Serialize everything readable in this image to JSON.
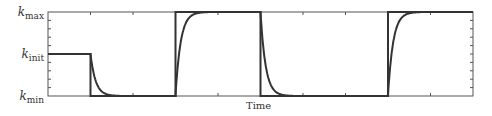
{
  "chart_data": {
    "type": "line",
    "title": "",
    "xlabel": "Time",
    "ylabel": "",
    "y_tick_labels": [
      {
        "base": "k",
        "sub": "max",
        "level": 1.0
      },
      {
        "base": "k",
        "sub": "init",
        "level": 0.5
      },
      {
        "base": "k",
        "sub": "min",
        "level": 0.0
      }
    ],
    "xlim": [
      0,
      10
    ],
    "ylim": [
      0,
      1
    ],
    "x_ticks": [
      0,
      1,
      2,
      3,
      4,
      5,
      6,
      7,
      8,
      9,
      10
    ],
    "y_minor_ticks": 10,
    "grid": false,
    "series": [
      {
        "name": "target (step input)",
        "style": "step",
        "x": [
          0,
          1,
          1,
          3,
          3,
          5,
          5,
          8,
          8,
          10
        ],
        "values": [
          0.5,
          0.5,
          0,
          0,
          1,
          1,
          0,
          0,
          1,
          1
        ]
      },
      {
        "name": "response (exponential relaxation)",
        "style": "smooth",
        "initial": 0.5,
        "steps_at": [
          1,
          3,
          5,
          8
        ],
        "targets": [
          0,
          1,
          0,
          1
        ],
        "time_constant": 0.12
      }
    ]
  },
  "labels": {
    "kmax_base": "k",
    "kmax_sub": "max",
    "kinit_base": "k",
    "kinit_sub": "init",
    "kmin_base": "k",
    "kmin_sub": "min",
    "xlabel": "Time"
  },
  "colors": {
    "frame": "#555555",
    "line": "#333333"
  }
}
